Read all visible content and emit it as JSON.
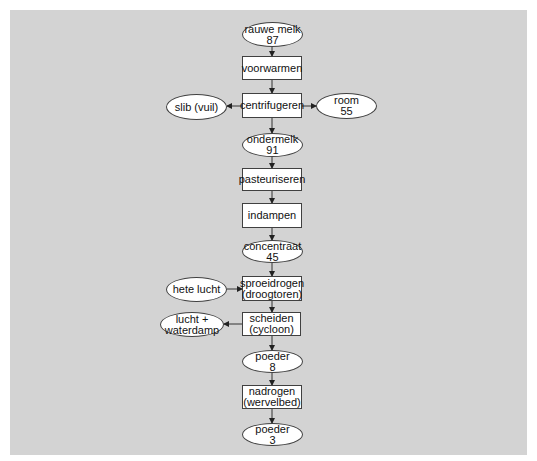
{
  "diagram": {
    "background_color": "#d3d3d3",
    "node_fill": "#ffffff",
    "stroke_color": "#404040",
    "nodes": {
      "rauwe_melk": {
        "shape": "ellipse",
        "label": "rauwe melk",
        "value": "87"
      },
      "voorwarmen": {
        "shape": "box",
        "label": "voorwarmen"
      },
      "centrifugeren": {
        "shape": "box",
        "label": "centrifugeren"
      },
      "slib": {
        "shape": "ellipse",
        "label": "slib (vuil)"
      },
      "room": {
        "shape": "ellipse",
        "label": "room",
        "value": "55"
      },
      "ondermelk": {
        "shape": "ellipse",
        "label": "ondermelk",
        "value": "91"
      },
      "pasteuriseren": {
        "shape": "box",
        "label": "pasteuriseren"
      },
      "indampen": {
        "shape": "box",
        "label": "indampen"
      },
      "concentraat": {
        "shape": "ellipse",
        "label": "concentraat",
        "value": "45"
      },
      "hete_lucht": {
        "shape": "ellipse",
        "label": "hete lucht"
      },
      "sproeidrogen": {
        "shape": "box",
        "label": "sproeidrogen",
        "sublabel": "(droogtoren)"
      },
      "scheiden": {
        "shape": "box",
        "label": "scheiden",
        "sublabel": "(cycloon)"
      },
      "lucht_waterdamp": {
        "shape": "ellipse",
        "label": "lucht +",
        "sublabel": "waterdamp"
      },
      "poeder_8": {
        "shape": "ellipse",
        "label": "poeder",
        "value": "8"
      },
      "nadrogen": {
        "shape": "box",
        "label": "nadrogen",
        "sublabel": "(wervelbed)"
      },
      "poeder_3": {
        "shape": "ellipse",
        "label": "poeder",
        "value": "3"
      }
    },
    "edges": [
      {
        "from": "rauwe melk",
        "to": "voorwarmen"
      },
      {
        "from": "voorwarmen",
        "to": "centrifugeren"
      },
      {
        "from": "centrifugeren",
        "to": "slib (vuil)"
      },
      {
        "from": "centrifugeren",
        "to": "room"
      },
      {
        "from": "centrifugeren",
        "to": "ondermelk"
      },
      {
        "from": "ondermelk",
        "to": "pasteuriseren"
      },
      {
        "from": "pasteuriseren",
        "to": "indampen"
      },
      {
        "from": "indampen",
        "to": "concentraat"
      },
      {
        "from": "concentraat",
        "to": "sproeidrogen"
      },
      {
        "from": "hete lucht",
        "to": "sproeidrogen"
      },
      {
        "from": "sproeidrogen",
        "to": "scheiden"
      },
      {
        "from": "scheiden",
        "to": "lucht + waterdamp"
      },
      {
        "from": "scheiden",
        "to": "poeder 8"
      },
      {
        "from": "poeder 8",
        "to": "nadrogen"
      },
      {
        "from": "nadrogen",
        "to": "poeder 3"
      }
    ]
  }
}
